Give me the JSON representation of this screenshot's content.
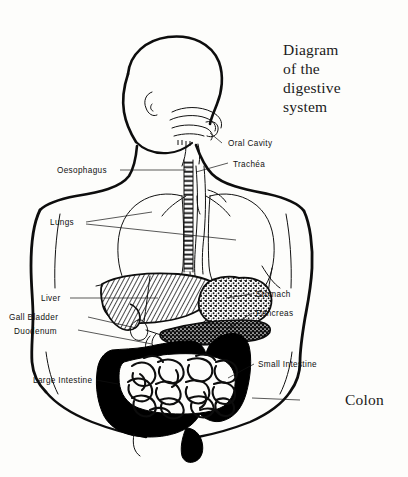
{
  "title": {
    "line1": "Diagram",
    "line2": "of the",
    "line3": "digestive",
    "line4": "system"
  },
  "colors": {
    "ink": "#111111",
    "paper": "#fdfdfb",
    "organ_fill_dark": "#000000"
  },
  "labels": {
    "oral_cavity": "Oral Cavity",
    "trachea": "Trachéa",
    "oesophagus": "Oesophagus",
    "lungs": "Lungs",
    "liver": "Liver",
    "gall_bladder": "Gall Bladder",
    "duodenum": "Duodenum",
    "stomach": "Stomach",
    "pancreas": "Pancreas",
    "small_intestine": "Small Intestine",
    "large_intestine": "Large Intestine",
    "colon": "Colon"
  }
}
